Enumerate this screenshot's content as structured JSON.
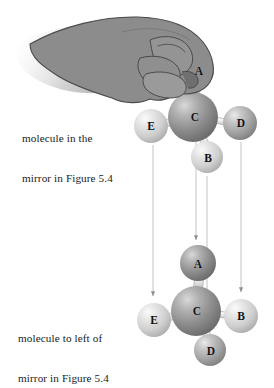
{
  "figure": {
    "background_color": "#ffffff",
    "captions": {
      "top": {
        "line1": "molecule in the",
        "line2": "mirror in Figure 5.4"
      },
      "bottom": {
        "line1": "molecule to left of",
        "line2": "mirror in Figure 5.4"
      }
    },
    "hand": {
      "name": "hand-grasping-sphere",
      "description": "left hand gripping the top sphere A from above",
      "fill_color": "#8c8c8c",
      "outline_color": "#3a3a3a",
      "shadow_color": "#bfbfbf"
    },
    "colors": {
      "sphere_dark": "#8e8e8e",
      "sphere_medium": "#a8a8a8",
      "sphere_light": "#d2d2d2",
      "bond": "#d8d8d8",
      "bond_outline": "#9a9a9a",
      "arrow": "#c3c3c3",
      "label_text": "#111111"
    },
    "molecules": [
      {
        "id": "mirror-molecule",
        "name": "molecule-in-the-mirror",
        "caption_ref": "top",
        "center": {
          "label": "C",
          "cx": 193,
          "cy": 117,
          "r": 25,
          "shade": "dark"
        },
        "atoms": [
          {
            "label": "A",
            "cx": 196,
            "cy": 70,
            "r": 18,
            "shade": "medium",
            "position": "up"
          },
          {
            "label": "E",
            "cx": 151,
            "cy": 126,
            "r": 17,
            "shade": "light",
            "position": "left"
          },
          {
            "label": "D",
            "cx": 240,
            "cy": 123,
            "r": 17,
            "shade": "medium",
            "position": "right"
          },
          {
            "label": "B",
            "cx": 207,
            "cy": 157,
            "r": 16,
            "shade": "light",
            "position": "down-right"
          }
        ]
      },
      {
        "id": "left-molecule",
        "name": "molecule-to-left-of-mirror",
        "caption_ref": "bottom",
        "center": {
          "label": "C",
          "cx": 196,
          "cy": 311,
          "r": 25,
          "shade": "dark"
        },
        "atoms": [
          {
            "label": "A",
            "cx": 198,
            "cy": 263,
            "r": 18,
            "shade": "dark",
            "position": "up"
          },
          {
            "label": "E",
            "cx": 154,
            "cy": 320,
            "r": 17,
            "shade": "light",
            "position": "left"
          },
          {
            "label": "B",
            "cx": 241,
            "cy": 316,
            "r": 17,
            "shade": "light",
            "position": "right"
          },
          {
            "label": "D",
            "cx": 210,
            "cy": 350,
            "r": 16,
            "shade": "medium",
            "position": "down-right"
          }
        ]
      }
    ],
    "arrows": [
      {
        "name": "arrow-E",
        "x": 153,
        "y_start": 145,
        "y_end": 296,
        "from_label": "E",
        "to_label": "E"
      },
      {
        "name": "arrow-A",
        "x": 196,
        "y_start": 140,
        "y_end": 240,
        "from_label": "A",
        "to_label": "A"
      },
      {
        "name": "arrow-B",
        "x": 207,
        "y_start": 176,
        "y_end": 333,
        "from_label": "B",
        "to_label": "B"
      },
      {
        "name": "arrow-D",
        "x": 241,
        "y_start": 142,
        "y_end": 292,
        "from_label": "D",
        "to_label": "D"
      }
    ]
  }
}
